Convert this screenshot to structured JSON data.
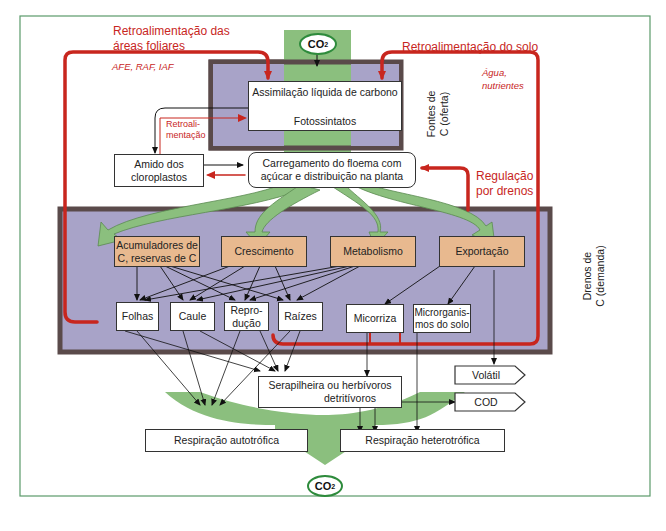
{
  "feedback": {
    "leaf_area": "Retroalimentação das áreas foliares",
    "leaf_area_line1": "Retroalimentação das",
    "leaf_area_line2": "áreas foliares",
    "leaf_area_params": "AFE, RAF, IAF",
    "soil": "Retroalimentação do solo",
    "soil_params_line1": "Água,",
    "soil_params_line2": "nutrientes",
    "internal_line1": "Retroali-",
    "internal_line2": "mentação",
    "sink_regulation_line1": "Regulação",
    "sink_regulation_line2": "por drenos"
  },
  "co2": {
    "top": "CO",
    "bottom": "CO",
    "sub": "2"
  },
  "sources": {
    "assimilation": "Assimilação líquida de carbono",
    "photosynthates": "Fotossintatos",
    "label_line1": "Fontes de",
    "label_line2": "C (oferta)"
  },
  "starch": {
    "line1": "Amido dos",
    "line2": "cloroplastos"
  },
  "phloem": {
    "line1": "Carregamento do floema com",
    "line2": "açúcar e distribuição na planta"
  },
  "sinks": {
    "label_line1": "Drenos de",
    "label_line2": "C (demanda)",
    "categories": [
      {
        "line1": "Acumuladores de",
        "line2": "C, reservas de C"
      },
      {
        "line1": "Crescimento",
        "line2": ""
      },
      {
        "line1": "Metabolismo",
        "line2": ""
      },
      {
        "line1": "Exportação",
        "line2": ""
      }
    ],
    "organs": [
      {
        "line1": "Folhas",
        "line2": ""
      },
      {
        "line1": "Caule",
        "line2": ""
      },
      {
        "line1": "Repro-",
        "line2": "dução"
      },
      {
        "line1": "Raízes",
        "line2": ""
      },
      {
        "line1": "Micorriza",
        "line2": ""
      },
      {
        "line1": "Microrganis-",
        "line2": "mos do solo"
      }
    ]
  },
  "litter": {
    "line1": "Serapilheira ou herbívoros",
    "line2": "detritívoros"
  },
  "outputs": {
    "volatile": "Volátil",
    "doc": "COD"
  },
  "respiration": {
    "auto": "Respiração autotrófica",
    "hetero": "Respiração heterotrófica"
  },
  "colors": {
    "frame": "#5a9a6a",
    "green_arrow": "#8bbf7e",
    "purple": "#a8a3c8",
    "purple_border": "#5a4a4a",
    "tan": "#e8b98f",
    "red": "#c8261e"
  }
}
